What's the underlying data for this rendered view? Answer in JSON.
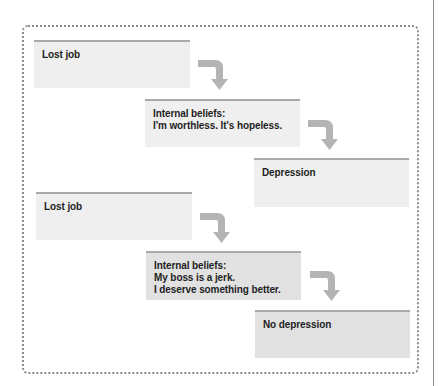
{
  "diagram": {
    "title": "",
    "colors": {
      "frame_border": "#8c8c8c",
      "box_stripe": "#a9a9a9",
      "box_fill_light": "#efefef",
      "box_fill_dark": "#e1e1e1",
      "arrow": "#b4b4b4",
      "text": "#1e1e1e"
    },
    "scenarios": [
      {
        "event": {
          "label": "Lost job"
        },
        "beliefs": {
          "heading": "Internal beliefs:",
          "lines": [
            "I'm worthless. It's hopeless."
          ]
        },
        "outcome": {
          "label": "Depression"
        }
      },
      {
        "event": {
          "label": "Lost job"
        },
        "beliefs": {
          "heading": "Internal beliefs:",
          "lines": [
            "My boss is a jerk.",
            "I deserve something better."
          ]
        },
        "outcome": {
          "label": "No depression"
        }
      }
    ],
    "icons": {
      "arrow": "bent-down-arrow-icon"
    }
  }
}
